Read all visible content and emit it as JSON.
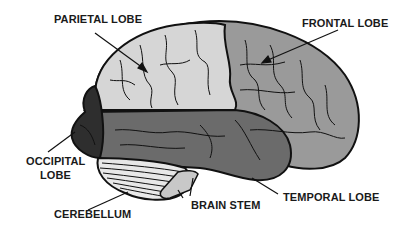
{
  "diagram": {
    "labels": {
      "parietal": "PARIETAL LOBE",
      "frontal": "FRONTAL LOBE",
      "occipital_line1": "OCCIPITAL",
      "occipital_line2": "LOBE",
      "cerebellum": "CEREBELLUM",
      "brain_stem": "BRAIN STEM",
      "temporal": "TEMPORAL LOBE"
    },
    "colors": {
      "parietal": "#d6d6d6",
      "frontal": "#9a9a9a",
      "temporal": "#6b6b6b",
      "occipital": "#2e2e2e",
      "cerebellum": "#e8e8e8",
      "brain_stem": "#c8c8c8",
      "outline": "#111111"
    }
  }
}
